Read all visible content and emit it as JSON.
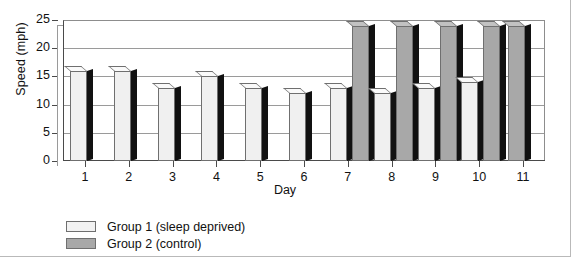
{
  "chart_data": {
    "type": "bar",
    "title": "",
    "xlabel": "Day",
    "ylabel": "Speed (mph)",
    "categories": [
      "1",
      "2",
      "3",
      "4",
      "5",
      "6",
      "7",
      "8",
      "9",
      "10",
      "11"
    ],
    "ylim": [
      0,
      25
    ],
    "yticks": [
      0,
      5,
      10,
      15,
      20,
      25
    ],
    "ytick_labels": [
      "0",
      "5",
      "10",
      "15",
      "20",
      "25"
    ],
    "grid": true,
    "legend_position": "below-left",
    "series": [
      {
        "name": "Group 1 (sleep deprived)",
        "color": "#f0f0f0",
        "values": [
          16,
          16,
          13,
          15,
          13,
          12,
          13,
          12,
          13,
          14,
          null
        ]
      },
      {
        "name": "Group 2 (control)",
        "color": "#a8a8a8",
        "values": [
          null,
          null,
          null,
          null,
          null,
          null,
          24,
          24,
          24,
          24,
          24
        ]
      }
    ]
  },
  "axes": {
    "y_title": "Speed (mph)",
    "x_title": "Day"
  },
  "legend": {
    "items": [
      {
        "label": "Group 1 (sleep deprived)",
        "swatch": "g1"
      },
      {
        "label": "Group 2 (control)",
        "swatch": "g2"
      }
    ]
  }
}
